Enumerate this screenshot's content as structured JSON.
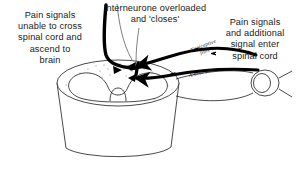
{
  "figure": {
    "background_color": "#ffffff",
    "ink_color": "#1a1a1a",
    "pathway_color": "#000000"
  },
  "annotations": {
    "left": "Pain signals\nunable to cross\nspinal cord and\nascend to\nbrain",
    "top": "Interneurone overloaded\nand 'closes'",
    "right": "Pain signals\nand additional\nsignal enter\nspinal cord"
  },
  "fibre_labels": {
    "nociceptive": "Nociceptive\nfibre",
    "a_beta": "A-beta fibre"
  },
  "structures": {
    "spinal_cord": "spinal-cord-segment",
    "grey_matter": "grey-matter-butterfly",
    "dorsal_root_ganglion": "dorsal-root-ganglion",
    "nerve_root": "spinal-nerve-root",
    "ascending_tract": "blocked-ascending-tract",
    "interneurone_marker": "interneurone-junction"
  }
}
